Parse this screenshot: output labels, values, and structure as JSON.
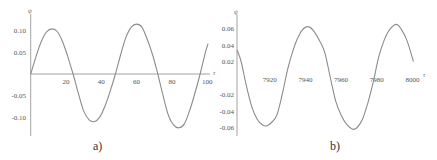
{
  "chart_data": [
    {
      "id": "a",
      "type": "line",
      "caption": "a)",
      "title": "",
      "xlabel": "τ",
      "ylabel": "ψ",
      "xlim": [
        0,
        100
      ],
      "ylim": [
        -0.13,
        0.12
      ],
      "x_ticks": [
        20,
        40,
        60,
        80,
        100
      ],
      "x_tick_labels": [
        "20",
        "40",
        "60",
        "80",
        "100"
      ],
      "y_ticks": [
        0.1,
        0.05,
        -0.05,
        -0.1
      ],
      "y_tick_labels": [
        "0.10",
        "0.05",
        "-0.05",
        "-0.10"
      ],
      "grid": false,
      "legend": null,
      "series": [
        {
          "name": "ψ(τ)",
          "color": "#8c8c8c",
          "x": [
            0,
            3,
            6,
            9,
            12,
            15,
            18,
            21,
            24,
            27,
            30,
            33,
            36,
            39,
            42,
            45,
            48,
            51,
            54,
            57,
            60,
            63,
            66,
            69,
            72,
            75,
            78,
            81,
            84,
            87,
            90,
            93,
            96,
            99,
            100.5
          ],
          "y": [
            0.0,
            0.04,
            0.075,
            0.097,
            0.104,
            0.098,
            0.075,
            0.04,
            0.0,
            -0.045,
            -0.085,
            -0.105,
            -0.11,
            -0.1,
            -0.075,
            -0.04,
            0.0,
            0.045,
            0.085,
            0.108,
            0.115,
            0.108,
            0.08,
            0.045,
            0.0,
            -0.05,
            -0.095,
            -0.118,
            -0.124,
            -0.115,
            -0.085,
            -0.045,
            0.0,
            0.05,
            0.07
          ]
        }
      ]
    },
    {
      "id": "b",
      "type": "line",
      "caption": "b)",
      "title": "",
      "xlabel": "τ",
      "ylabel": "ψ",
      "xlim": [
        7901.7,
        8000
      ],
      "ylim": [
        -0.065,
        0.068
      ],
      "x_ticks": [
        7920,
        7940,
        7960,
        7980,
        8000
      ],
      "x_tick_labels": [
        "7920",
        "7940",
        "7960",
        "7980",
        "8000"
      ],
      "y_ticks": [
        0.06,
        0.04,
        0.02,
        -0.02,
        -0.04,
        -0.06
      ],
      "y_tick_labels": [
        "0.06",
        "0.04",
        "0.02",
        "-0.02",
        "-0.04",
        "-0.06"
      ],
      "grid": false,
      "legend": null,
      "series": [
        {
          "name": "ψ(τ)",
          "color": "#8c8c8c",
          "x": [
            7901.7,
            7904,
            7907,
            7910,
            7913,
            7916,
            7918.5,
            7921,
            7924,
            7927,
            7930,
            7933,
            7936,
            7939,
            7942,
            7945,
            7948,
            7951,
            7954,
            7957,
            7960,
            7963,
            7966.5,
            7969,
            7972,
            7975,
            7978,
            7981,
            7984,
            7987,
            7991,
            7994,
            7997,
            8000.5
          ],
          "y": [
            0.034,
            0.02,
            -0.01,
            -0.035,
            -0.05,
            -0.057,
            -0.058,
            -0.054,
            -0.045,
            -0.02,
            0.01,
            0.033,
            0.05,
            0.06,
            0.062,
            0.056,
            0.045,
            0.03,
            0.0,
            -0.028,
            -0.045,
            -0.056,
            -0.062,
            -0.06,
            -0.05,
            -0.03,
            -0.005,
            0.025,
            0.045,
            0.058,
            0.065,
            0.058,
            0.045,
            0.02
          ]
        }
      ]
    }
  ],
  "panels": {
    "a": {
      "caption": "a)",
      "y_axis_name": "ψ",
      "x_axis_name": "τ"
    },
    "b": {
      "caption": "b)",
      "y_axis_name": "ψ",
      "x_axis_name": "τ"
    }
  }
}
